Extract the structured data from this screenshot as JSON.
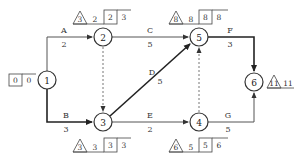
{
  "diagram": {
    "type": "activity-on-arrow network (double-code network)",
    "nodes": [
      {
        "id": "1",
        "label": "1",
        "es": "0",
        "ls": "0",
        "boxes": [
          "0"
        ],
        "tri": null
      },
      {
        "id": "2",
        "label": "2",
        "tri": "3",
        "tf": "2",
        "boxes": [
          "2",
          "3"
        ]
      },
      {
        "id": "3",
        "label": "3",
        "tri": "3",
        "tf": "3",
        "boxes": [
          "3",
          "3"
        ]
      },
      {
        "id": "4",
        "label": "4",
        "tri": "6",
        "tf": "5",
        "boxes": [
          "5",
          "6"
        ]
      },
      {
        "id": "5",
        "label": "5",
        "tri": "8",
        "tf": "8",
        "boxes": [
          "8",
          "8"
        ]
      },
      {
        "id": "6",
        "label": "6",
        "tri": "11",
        "tf": "11"
      }
    ],
    "activities": [
      {
        "name": "A",
        "duration": "2",
        "from": "1",
        "to": "2",
        "critical": false
      },
      {
        "name": "B",
        "duration": "3",
        "from": "1",
        "to": "3",
        "critical": true
      },
      {
        "name": "C",
        "duration": "5",
        "from": "2",
        "to": "5",
        "critical": false
      },
      {
        "name": "D",
        "duration": "5",
        "from": "3",
        "to": "5",
        "critical": true
      },
      {
        "name": "E",
        "duration": "2",
        "from": "3",
        "to": "4",
        "critical": false
      },
      {
        "name": "F",
        "duration": "3",
        "from": "5",
        "to": "6",
        "critical": true
      },
      {
        "name": "G",
        "duration": "5",
        "from": "4",
        "to": "6",
        "critical": false
      }
    ],
    "dummies": [
      {
        "from": "2",
        "to": "3"
      },
      {
        "from": "4",
        "to": "5"
      }
    ],
    "node1": {
      "box": "0",
      "val": "0"
    }
  }
}
